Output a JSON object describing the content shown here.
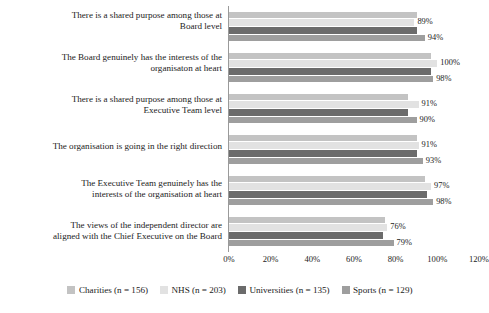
{
  "chart_data": {
    "type": "bar",
    "orientation": "horizontal",
    "title": "",
    "xlabel": "",
    "ylabel": "",
    "xlim": [
      0,
      120
    ],
    "xticks": [
      "0%",
      "20%",
      "40%",
      "60%",
      "80%",
      "100%",
      "120%"
    ],
    "xtick_values": [
      0,
      20,
      40,
      60,
      80,
      100,
      120
    ],
    "grid": false,
    "legend_position": "bottom",
    "categories": [
      "There is a shared purpose among those at Board level",
      "The Board genuinely has the interests of the organisaton at heart",
      "There is a shared purpose among those at Executive Team level",
      "The organisation is going in the right direction",
      "The Executive Team genuinely has the interests of the organisation at heart",
      "The views of the independent director are aligned with the Chief Executive on the Board"
    ],
    "category_lines": [
      [
        "There is a shared purpose among those at",
        "Board level"
      ],
      [
        "The Board genuinely has the interests of the",
        "organisaton at heart"
      ],
      [
        "There is a shared purpose among those at",
        "Executive Team level"
      ],
      [
        "The organisation is going in the right direction"
      ],
      [
        "The Executive Team genuinely has the",
        "interests of the organisation at heart"
      ],
      [
        "The views of the independent director are",
        "aligned with the Chief Executive on the Board"
      ]
    ],
    "series": [
      {
        "name": "Charities (n = 156)",
        "color": "#c3c3c3",
        "values": [
          90,
          97,
          86,
          90,
          94,
          75
        ],
        "labels": [
          "",
          "",
          "",
          "",
          "",
          ""
        ],
        "labels_visible": false
      },
      {
        "name": "NHS (n = 203)",
        "color": "#e2e2e2",
        "values": [
          89,
          100,
          91,
          91,
          97,
          76
        ],
        "labels": [
          "89%",
          "100%",
          "91%",
          "91%",
          "97%",
          "76%"
        ],
        "labels_visible": true
      },
      {
        "name": "Universities (n = 135)",
        "color": "#6b6b6b",
        "values": [
          90,
          97,
          86,
          90,
          95,
          74
        ],
        "labels": [
          "",
          "",
          "",
          "",
          "",
          ""
        ],
        "labels_visible": false
      },
      {
        "name": "Sports (n = 129)",
        "color": "#9e9e9e",
        "values": [
          94,
          98,
          90,
          93,
          98,
          79
        ],
        "labels": [
          "94%",
          "98%",
          "90%",
          "93%",
          "98%",
          "79%"
        ],
        "labels_visible": true
      }
    ]
  },
  "legend": {
    "items": [
      {
        "label": "Charities (n = 156)",
        "color": "#c3c3c3"
      },
      {
        "label": "NHS (n = 203)",
        "color": "#e2e2e2"
      },
      {
        "label": "Universities (n = 135)",
        "color": "#6b6b6b"
      },
      {
        "label": "Sports (n = 129)",
        "color": "#9e9e9e"
      }
    ]
  },
  "axis": {
    "line_color": "#9a9a9a"
  }
}
